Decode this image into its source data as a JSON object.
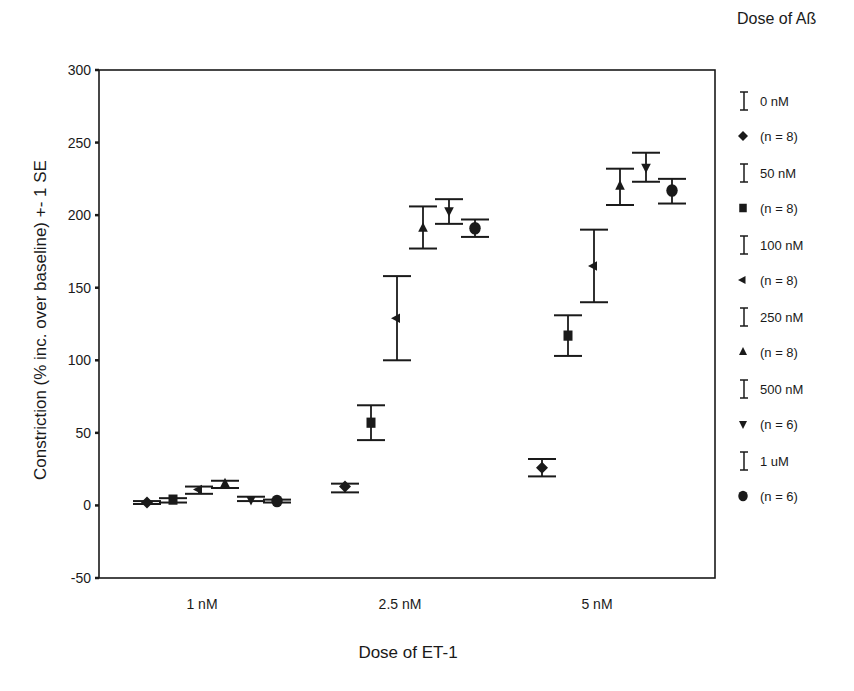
{
  "chart_data": {
    "type": "scatter",
    "subtype": "grouped error-bar plot",
    "title": "",
    "xlabel": "Dose of ET-1",
    "ylabel": "Constriction (% inc. over baseline) +- 1 SE",
    "categories": [
      "1 nM",
      "2.5 nM",
      "5 nM"
    ],
    "ylim": [
      -50,
      300
    ],
    "yticks": [
      -50,
      0,
      50,
      100,
      150,
      200,
      250,
      300
    ],
    "grid": false,
    "legend_title": "Dose of Aß",
    "legend_position": "right",
    "series": [
      {
        "name": "0 nM",
        "n_label": "(n = 8)",
        "marker": "diamond",
        "values": [
          2,
          13,
          26
        ],
        "err_low": [
          1,
          9,
          20
        ],
        "err_high": [
          3,
          15,
          32
        ]
      },
      {
        "name": "50 nM",
        "n_label": "(n = 8)",
        "marker": "square",
        "values": [
          4,
          57,
          117
        ],
        "err_low": [
          2,
          45,
          103
        ],
        "err_high": [
          5,
          69,
          131
        ]
      },
      {
        "name": "100 nM",
        "n_label": "(n = 8)",
        "marker": "triangle-left",
        "values": [
          11,
          129,
          165
        ],
        "err_low": [
          8,
          100,
          140
        ],
        "err_high": [
          13,
          158,
          190
        ]
      },
      {
        "name": "250 nM",
        "n_label": "(n = 8)",
        "marker": "triangle-up",
        "values": [
          15,
          191,
          220
        ],
        "err_low": [
          12,
          177,
          207
        ],
        "err_high": [
          17,
          206,
          232
        ]
      },
      {
        "name": "500 nM",
        "n_label": "(n = 6)",
        "marker": "triangle-down",
        "values": [
          4,
          203,
          233
        ],
        "err_low": [
          3,
          194,
          223
        ],
        "err_high": [
          6,
          211,
          243
        ]
      },
      {
        "name": "1 uM",
        "n_label": "(n = 6)",
        "marker": "circle",
        "values": [
          3,
          191,
          217
        ],
        "err_low": [
          2,
          185,
          208
        ],
        "err_high": [
          4,
          197,
          225
        ]
      }
    ]
  },
  "colors": {
    "ink": "#1a1a1a",
    "background": "#ffffff"
  }
}
